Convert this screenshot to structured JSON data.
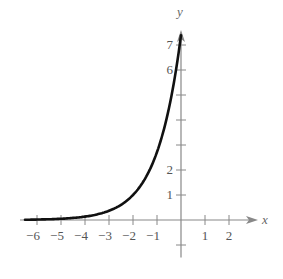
{
  "chart_data": {
    "type": "line",
    "title": "",
    "xlabel": "x",
    "ylabel": "y",
    "xlim": [
      -6.5,
      3
    ],
    "ylim": [
      -1,
      7.5
    ],
    "x_ticks": [
      -6,
      -5,
      -4,
      -3,
      -2,
      -1,
      1,
      2
    ],
    "x_tick_labels": [
      "−6",
      "−5",
      "−4",
      "−3",
      "−2",
      "−1",
      "1",
      "2"
    ],
    "y_ticks": [
      1,
      2,
      3,
      4,
      5,
      6,
      7,
      -1
    ],
    "y_tick_labels": [
      "1",
      "2",
      "",
      "",
      "",
      "6",
      "7"
    ],
    "grid": false,
    "series": [
      {
        "name": "exponential curve",
        "x": [
          -6.5,
          -6,
          -5,
          -4,
          -3,
          -2,
          -1,
          -0.5,
          0
        ],
        "values": [
          0.01,
          0.02,
          0.05,
          0.14,
          0.37,
          1.0,
          2.72,
          4.48,
          7.39
        ]
      }
    ],
    "line_color": "#111111",
    "axis_color": "#888888"
  }
}
